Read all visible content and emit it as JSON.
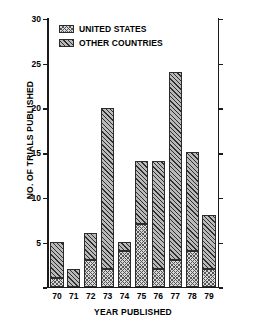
{
  "chart_data": {
    "type": "bar",
    "subtype": "stacked-bar",
    "title": "",
    "xlabel": "YEAR PUBLISHED",
    "ylabel": "NO. OF TRIALS PUBLISHED",
    "categories": [
      "70",
      "71",
      "72",
      "73",
      "74",
      "75",
      "76",
      "77",
      "78",
      "79"
    ],
    "series": [
      {
        "name": "UNITED STATES",
        "swatch": "stipple-light",
        "values": [
          1,
          0,
          3,
          2,
          4,
          7,
          2,
          3,
          4,
          2
        ]
      },
      {
        "name": "OTHER COUNTRIES",
        "swatch": "hatch-dark",
        "values": [
          4,
          2,
          3,
          18,
          1,
          7,
          12,
          21,
          11,
          6
        ]
      }
    ],
    "totals": [
      5,
      2,
      6,
      20,
      5,
      14,
      14,
      24,
      15,
      8
    ],
    "ylim": [
      0,
      30
    ],
    "yticks": [
      0,
      5,
      10,
      15,
      20,
      25,
      30
    ],
    "ytick_labels": [
      "",
      "5",
      "10",
      "15",
      "20",
      "25",
      "30"
    ],
    "grid": false,
    "legend_position": "top-left",
    "colors": {
      "axis": "#1a1a1a",
      "united_states": "#d8d8d8",
      "other_countries": "#b9b9b9",
      "background": "#ffffff"
    }
  },
  "legend": {
    "items": [
      {
        "label": "UNITED STATES"
      },
      {
        "label": "OTHER COUNTRIES"
      }
    ]
  }
}
